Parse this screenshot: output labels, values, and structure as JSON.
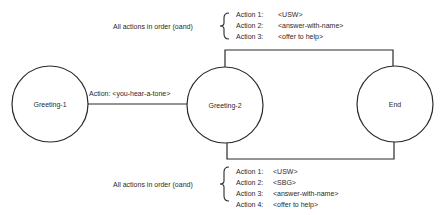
{
  "nodes": [
    {
      "id": "greeting-1",
      "label": "Greeting-1"
    },
    {
      "id": "greeting-2",
      "label": "Greeting-2"
    },
    {
      "id": "end",
      "label": "End"
    }
  ],
  "edges": [
    {
      "from": "Greeting-1",
      "to": "Greeting-2",
      "label": "Action: <you-hear-a-tone>"
    },
    {
      "from": "Greeting-2",
      "to": "End",
      "route": "top"
    },
    {
      "from": "Greeting-2",
      "to": "End",
      "route": "bottom"
    }
  ],
  "top_group": {
    "caption": "All actions in order (oand)",
    "actions": [
      {
        "label": "Action 1:",
        "value": "<USW>"
      },
      {
        "label": "Action 2:",
        "value": "<answer-with-name>"
      },
      {
        "label": "Action 3:",
        "value": "<offer to help>"
      }
    ]
  },
  "bottom_group": {
    "caption": "All actions in order (oand)",
    "actions": [
      {
        "label": "Action 1:",
        "value": "<USW>"
      },
      {
        "label": "Action 2:",
        "value": "<SBG>"
      },
      {
        "label": "Action 3:",
        "value": "<answer-with-name>"
      },
      {
        "label": "Action 4:",
        "value": "<offer to help>"
      }
    ]
  },
  "colors": {
    "stroke": "#2a2a2a",
    "background": "#ffffff"
  }
}
